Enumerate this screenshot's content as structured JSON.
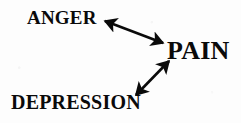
{
  "diagram": {
    "background_color": "#fdfdfd",
    "ink_color": "#0a0a0a",
    "width": 241,
    "height": 123,
    "nodes": [
      {
        "id": "anger",
        "label": "ANGER",
        "position": "top-left",
        "x": 27,
        "y": 8,
        "font_size_px": 19
      },
      {
        "id": "pain",
        "label": "PAIN",
        "position": "middle-right",
        "x": 167,
        "y": 38,
        "font_size_px": 26
      },
      {
        "id": "depression",
        "label": "DEPRESSION",
        "position": "bottom-left",
        "x": 11,
        "y": 92,
        "font_size_px": 20
      }
    ],
    "edges": [
      {
        "id": "anger-pain",
        "from": "anger",
        "to": "pain",
        "style": "double-headed-arrow",
        "x1": 105,
        "y1": 21,
        "x2": 163,
        "y2": 43,
        "stroke_width": 2.6
      },
      {
        "id": "depression-pain",
        "from": "depression",
        "to": "pain",
        "style": "double-headed-arrow",
        "x1": 136,
        "y1": 95,
        "x2": 169,
        "y2": 61,
        "stroke_width": 2.6
      }
    ]
  }
}
